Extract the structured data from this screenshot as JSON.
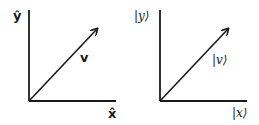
{
  "diagrams": [
    {
      "name": "unit-vector-notation",
      "y_label": "ŷ",
      "x_label": "x̂",
      "vector_label": "v"
    },
    {
      "name": "dirac-notation",
      "y_label": "|y⟩",
      "x_label": "|x⟩",
      "vector_label": "|v⟩"
    }
  ],
  "colors": {
    "stroke": "#1a1a1a",
    "background": "#ffffff"
  }
}
